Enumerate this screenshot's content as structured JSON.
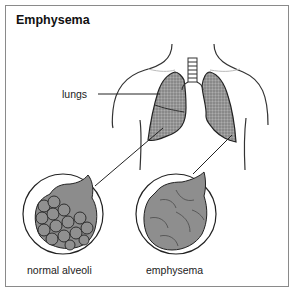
{
  "title": "Emphysema",
  "labels": {
    "lungs": "lungs",
    "normal": "normal alveoli",
    "emphysema": "emphysema"
  },
  "colors": {
    "frame": "#8a8a8a",
    "tissue": "#8c8c8c",
    "outline": "#222222"
  }
}
